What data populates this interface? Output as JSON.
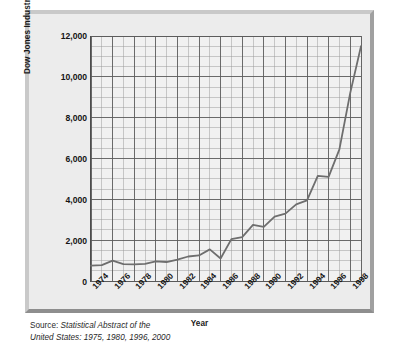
{
  "chart_data": {
    "type": "line",
    "title": "",
    "xlabel": "Year",
    "ylabel": "Dow Jones Industrial Average",
    "xlim": [
      1974,
      1999
    ],
    "ylim": [
      0,
      12000
    ],
    "y_ticks": [
      0,
      2000,
      4000,
      6000,
      8000,
      10000,
      12000
    ],
    "y_tick_labels": [
      "0",
      "2,000",
      "4,000",
      "6,000",
      "8,000",
      "10,000",
      "12,000"
    ],
    "y_minor_step": 500,
    "x_ticks": [
      1974,
      1976,
      1978,
      1980,
      1982,
      1984,
      1986,
      1988,
      1990,
      1992,
      1994,
      1996,
      1998
    ],
    "x_tick_labels": [
      "1974",
      "1976",
      "1978",
      "1980",
      "1982",
      "1984",
      "1986",
      "1988",
      "1990",
      "1992",
      "1994",
      "1996",
      "1998"
    ],
    "x_minor_step": 1,
    "grid": true,
    "legend": "none",
    "line_color": "#6e6e6e",
    "x": [
      1974,
      1975,
      1976,
      1977,
      1978,
      1979,
      1980,
      1981,
      1982,
      1983,
      1984,
      1985,
      1986,
      1987,
      1988,
      1989,
      1990,
      1991,
      1992,
      1993,
      1994,
      1995,
      1996,
      1997,
      1998,
      1999
    ],
    "values": [
      750,
      780,
      1000,
      830,
      810,
      840,
      960,
      930,
      1050,
      1200,
      1250,
      1550,
      1100,
      2050,
      2150,
      2750,
      2650,
      3150,
      3300,
      3750,
      3950,
      5150,
      5100,
      6450,
      9200,
      11500
    ],
    "series": [
      {
        "name": "Dow Jones Industrial Average",
        "values": [
          750,
          780,
          1000,
          830,
          810,
          840,
          960,
          930,
          1050,
          1200,
          1250,
          1550,
          1100,
          2050,
          2150,
          2750,
          2650,
          3150,
          3300,
          3750,
          3950,
          5150,
          5100,
          6450,
          9200,
          11500
        ]
      }
    ]
  },
  "source": {
    "lead": "Source: ",
    "line1_italic": "Statistical Abstract of the",
    "line2_italic": "United States: 1975, 1980, 1996, 2000"
  },
  "colors": {
    "frame": "#e9e9e9",
    "plot_background": "#f1f1f1",
    "major_grid": "#5a5a5a",
    "minor_grid": "#9a9a9a",
    "axis": "#4d4d4d",
    "line": "#6e6e6e",
    "text": "#141414"
  }
}
